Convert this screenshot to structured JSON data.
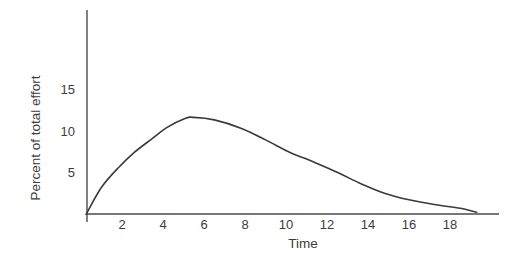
{
  "chart_data": {
    "type": "line",
    "title": "",
    "xlabel": "Time",
    "ylabel": "Percent of total effort",
    "xlim": [
      0,
      20.5
    ],
    "ylim": [
      0,
      24
    ],
    "x_ticks": [
      2,
      4,
      6,
      8,
      10,
      12,
      14,
      16,
      18
    ],
    "y_ticks": [
      5,
      10,
      15
    ],
    "grid": false,
    "legend": null,
    "series": [
      {
        "name": "effort",
        "color": "#3a3a3a",
        "x": [
          0.3,
          1.0,
          1.8,
          2.6,
          3.5,
          4.2,
          5.1,
          5.5,
          6.5,
          7.8,
          9.0,
          10.2,
          11.4,
          12.6,
          13.6,
          14.8,
          16.0,
          17.3,
          18.5,
          19.3
        ],
        "y": [
          0.2,
          3.2,
          5.5,
          7.4,
          9.1,
          10.4,
          11.5,
          11.6,
          11.3,
          10.3,
          8.9,
          7.4,
          6.2,
          4.9,
          3.7,
          2.5,
          1.7,
          1.1,
          0.7,
          0.2
        ]
      }
    ]
  },
  "colors": {
    "axis": "#4a4a4a",
    "line": "#3a3a3a",
    "text": "#3c3c3c",
    "background": "#ffffff"
  }
}
